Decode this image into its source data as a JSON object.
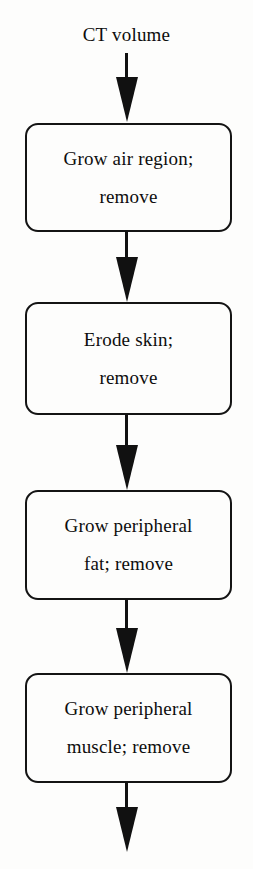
{
  "diagram": {
    "title_caption": "CT volume",
    "orientation": "top-to-bottom",
    "accent_color": "#111111",
    "background_color": "#fdfdfc",
    "steps": [
      {
        "id": "grow-air-region",
        "line1": "Grow air region;",
        "line2": "remove"
      },
      {
        "id": "erode-skin",
        "line1": "Erode skin;",
        "line2": "remove"
      },
      {
        "id": "grow-peripheral-fat",
        "line1": "Grow peripheral",
        "line2": "fat; remove"
      },
      {
        "id": "grow-peripheral-muscle",
        "line1": "Grow peripheral",
        "line2": "muscle; remove"
      }
    ],
    "connectors": [
      {
        "id": "connector-input-to-step1"
      },
      {
        "id": "connector-step1-to-step2"
      },
      {
        "id": "connector-step2-to-step3"
      },
      {
        "id": "connector-step3-to-step4"
      },
      {
        "id": "connector-step4-to-output"
      }
    ]
  }
}
